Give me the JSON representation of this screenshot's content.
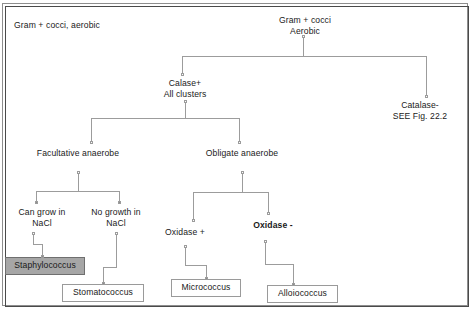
{
  "figure": {
    "caption": "Gram + cocci, aerobic",
    "root": {
      "label": "Gram + cocci\nAerobic"
    },
    "nodes": [
      {
        "id": "catalase_pos",
        "label": "Calase+\nAll clusters",
        "bold": false
      },
      {
        "id": "catalase_neg",
        "label": "Catalase-\nSEE Fig. 22.2",
        "bold": false
      },
      {
        "id": "facultative",
        "label": "Facultative anaerobe",
        "bold": false
      },
      {
        "id": "obligate",
        "label": "Obligate anaerobe",
        "bold": false
      },
      {
        "id": "nacl_growth",
        "label": "Can grow in\nNaCl",
        "bold": false
      },
      {
        "id": "nacl_nogrowth",
        "label": "No growth in\nNaCl",
        "bold": false
      },
      {
        "id": "oxidase_pos",
        "label": "Oxidase +",
        "bold": false
      },
      {
        "id": "oxidase_neg",
        "label": "Oxidase -",
        "bold": true
      }
    ],
    "terminals": [
      {
        "id": "staphylococcus",
        "label": "Staphylococcus",
        "shaded": true
      },
      {
        "id": "stomatococcus",
        "label": "Stomatococcus",
        "shaded": false
      },
      {
        "id": "micrococcus",
        "label": "Micrococcus",
        "shaded": false
      },
      {
        "id": "alloiococcus",
        "label": "Alloiococcus",
        "shaded": false
      }
    ],
    "colors": {
      "line": "#9c9c9c",
      "text": "#1a1a1a",
      "shaded_fill": "#a6a6a6",
      "frame_inner": "#4a4a4a",
      "frame_outer": "#8e8e8e"
    }
  }
}
